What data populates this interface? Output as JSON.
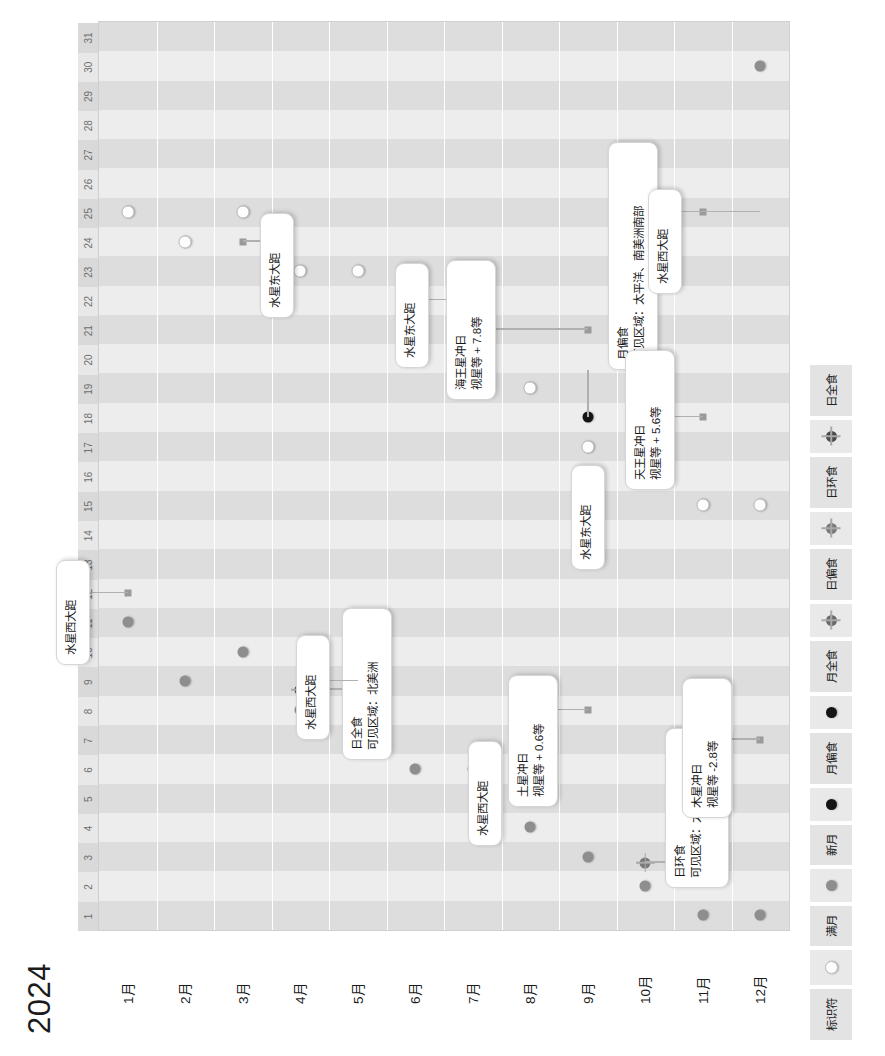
{
  "top_note": "天文年历 2024 事件一览",
  "title": "2024",
  "legend": {
    "label": "标识符",
    "items": [
      {
        "name": "满月",
        "icon": "full-moon-icon"
      },
      {
        "name": "新月",
        "icon": "new-moon-icon"
      },
      {
        "name": "月偏食",
        "icon": "partial-lunar-eclipse-icon"
      },
      {
        "name": "月全食",
        "icon": "total-lunar-eclipse-icon"
      },
      {
        "name": "日偏食",
        "icon": "partial-solar-eclipse-icon"
      },
      {
        "name": "日环食",
        "icon": "annular-solar-eclipse-icon"
      },
      {
        "name": "日全食",
        "icon": "total-solar-eclipse-icon"
      }
    ]
  },
  "days": [
    "1",
    "2",
    "3",
    "4",
    "5",
    "6",
    "7",
    "8",
    "9",
    "10",
    "11",
    "12",
    "13",
    "14",
    "15",
    "16",
    "17",
    "18",
    "19",
    "20",
    "21",
    "22",
    "23",
    "24",
    "25",
    "26",
    "27",
    "28",
    "29",
    "30",
    "31"
  ],
  "months": [
    {
      "label": "1月",
      "index": 0
    },
    {
      "label": "2月",
      "index": 1
    },
    {
      "label": "3月",
      "index": 2
    },
    {
      "label": "4月",
      "index": 3
    },
    {
      "label": "5月",
      "index": 4
    },
    {
      "label": "6月",
      "index": 5
    },
    {
      "label": "7月",
      "index": 6
    },
    {
      "label": "8月",
      "index": 7
    },
    {
      "label": "9月",
      "index": 8
    },
    {
      "label": "10月",
      "index": 9
    },
    {
      "label": "11月",
      "index": 10
    },
    {
      "label": "12月",
      "index": 11
    }
  ],
  "markers": [
    {
      "month": 0,
      "day": 11,
      "type": "new-moon"
    },
    {
      "month": 0,
      "day": 12,
      "type": "event-square"
    },
    {
      "month": 0,
      "day": 25,
      "type": "full-moon"
    },
    {
      "month": 1,
      "day": 9,
      "type": "new-moon"
    },
    {
      "month": 1,
      "day": 24,
      "type": "full-moon"
    },
    {
      "month": 2,
      "day": 10,
      "type": "new-moon"
    },
    {
      "month": 2,
      "day": 24,
      "type": "event-square"
    },
    {
      "month": 2,
      "day": 25,
      "type": "full-moon"
    },
    {
      "month": 3,
      "day": 8,
      "type": "new-moon"
    },
    {
      "month": 3,
      "day": 8.7,
      "type": "total-solar-eclipse"
    },
    {
      "month": 3,
      "day": 23,
      "type": "full-moon"
    },
    {
      "month": 4,
      "day": 8,
      "type": "new-moon"
    },
    {
      "month": 4,
      "day": 9,
      "type": "event-square"
    },
    {
      "month": 4,
      "day": 23,
      "type": "full-moon"
    },
    {
      "month": 5,
      "day": 6,
      "type": "new-moon"
    },
    {
      "month": 5,
      "day": 22,
      "type": "full-moon"
    },
    {
      "month": 6,
      "day": 6,
      "type": "new-moon"
    },
    {
      "month": 6,
      "day": 21,
      "type": "full-moon"
    },
    {
      "month": 6,
      "day": 22,
      "type": "event-square"
    },
    {
      "month": 7,
      "day": 4,
      "type": "new-moon"
    },
    {
      "month": 7,
      "day": 5,
      "type": "event-square"
    },
    {
      "month": 7,
      "day": 19,
      "type": "full-moon"
    },
    {
      "month": 8,
      "day": 3,
      "type": "new-moon"
    },
    {
      "month": 8,
      "day": 8,
      "type": "event-square"
    },
    {
      "month": 8,
      "day": 17,
      "type": "full-moon"
    },
    {
      "month": 8,
      "day": 18,
      "type": "partial-lunar-eclipse"
    },
    {
      "month": 8,
      "day": 21,
      "type": "event-square"
    },
    {
      "month": 9,
      "day": 2,
      "type": "new-moon"
    },
    {
      "month": 9,
      "day": 2.8,
      "type": "annular-solar-eclipse"
    },
    {
      "month": 9,
      "day": 17,
      "type": "full-moon"
    },
    {
      "month": 9,
      "day": 16,
      "type": "event-square"
    },
    {
      "month": 10,
      "day": 1,
      "type": "new-moon"
    },
    {
      "month": 10,
      "day": 15,
      "type": "full-moon"
    },
    {
      "month": 10,
      "day": 18,
      "type": "event-square"
    },
    {
      "month": 10,
      "day": 25,
      "type": "event-square"
    },
    {
      "month": 11,
      "day": 1,
      "type": "new-moon"
    },
    {
      "month": 11,
      "day": 7,
      "type": "event-square"
    },
    {
      "month": 11,
      "day": 15,
      "type": "full-moon"
    },
    {
      "month": 11,
      "day": 30,
      "type": "new-moon"
    }
  ],
  "callouts": [
    {
      "id": "jan-mercury-west",
      "line1": "水星西大距",
      "line2": ""
    },
    {
      "id": "mar-mercury-east",
      "line1": "水星东大距",
      "line2": ""
    },
    {
      "id": "apr-total-solar",
      "line1": "日全食",
      "line2": "可见区域：北美洲"
    },
    {
      "id": "may-mercury-west",
      "line1": "水星西大距",
      "line2": ""
    },
    {
      "id": "jul-mercury-east",
      "line1": "水星东大距",
      "line2": ""
    },
    {
      "id": "aug-mercury-west",
      "line1": "水星西大距",
      "line2": ""
    },
    {
      "id": "sep-saturn-opp",
      "line1": "土星冲日",
      "line2": "视星等 + 0.6等"
    },
    {
      "id": "sep-neptune-opp",
      "line1": "海王星冲日",
      "line2": "视星等 + 7.8等"
    },
    {
      "id": "sep-partial-lunar",
      "line1": "月偏食",
      "line2": "可见区域：太平洋、南美洲南部"
    },
    {
      "id": "oct-annular-solar",
      "line1": "日环食",
      "line2": "可见区域：太平洋、南美洲南部"
    },
    {
      "id": "oct-mercury-east",
      "line1": "水星东大距",
      "line2": ""
    },
    {
      "id": "nov-uranus-opp",
      "line1": "天王星冲日",
      "line2": "视星等 + 5.6等"
    },
    {
      "id": "dec-mercury-west",
      "line1": "水星西大距",
      "line2": ""
    },
    {
      "id": "dec-jupiter-opp",
      "line1": "木星冲日",
      "line2": "视星等 -2.8等"
    }
  ],
  "colors": {
    "band_dark": "#dddddd",
    "band_light": "#ededed",
    "grid_bg": "#f2f2f2",
    "legend_bg": "#e3e3e3",
    "marker_new": "#8e8e8e",
    "marker_full": "#fdfdfd",
    "marker_eclipse": "#141414",
    "callout_bg": "#ffffff"
  }
}
